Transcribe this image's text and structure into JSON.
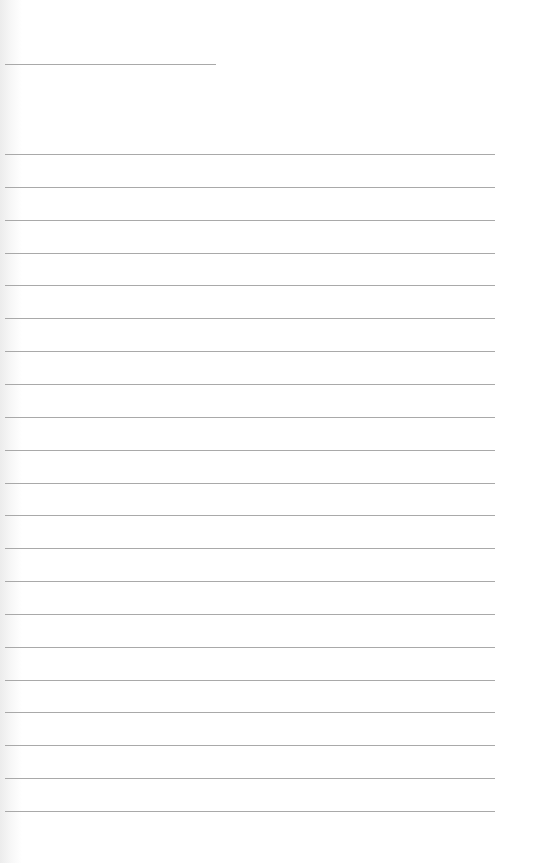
{
  "document": {
    "type": "lined-paper",
    "title_line": {
      "text": ""
    },
    "lines": [
      {
        "text": ""
      },
      {
        "text": ""
      },
      {
        "text": ""
      },
      {
        "text": ""
      },
      {
        "text": ""
      },
      {
        "text": ""
      },
      {
        "text": ""
      },
      {
        "text": ""
      },
      {
        "text": ""
      },
      {
        "text": ""
      },
      {
        "text": ""
      },
      {
        "text": ""
      },
      {
        "text": ""
      },
      {
        "text": ""
      },
      {
        "text": ""
      },
      {
        "text": ""
      },
      {
        "text": ""
      },
      {
        "text": ""
      },
      {
        "text": ""
      },
      {
        "text": ""
      },
      {
        "text": ""
      }
    ],
    "colors": {
      "paper": "#ffffff",
      "rule": "#a9a9a9"
    }
  }
}
